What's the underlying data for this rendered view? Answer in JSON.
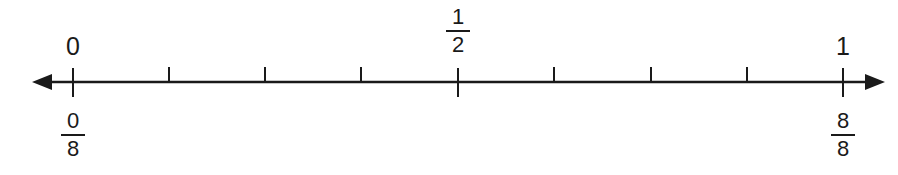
{
  "number_line": {
    "min": 0,
    "max": 1,
    "divisions": 8,
    "line_color": "#1a1a1a",
    "top_labels": {
      "start": "0",
      "middle": {
        "numerator": "1",
        "denominator": "2"
      },
      "end": "1"
    },
    "bottom_labels": {
      "start": {
        "numerator": "0",
        "denominator": "8"
      },
      "end": {
        "numerator": "8",
        "denominator": "8"
      }
    },
    "ticks": [
      {
        "position": "0/8",
        "major": true
      },
      {
        "position": "1/8",
        "major": false
      },
      {
        "position": "2/8",
        "major": false
      },
      {
        "position": "3/8",
        "major": false
      },
      {
        "position": "4/8",
        "major": true
      },
      {
        "position": "5/8",
        "major": false
      },
      {
        "position": "6/8",
        "major": false
      },
      {
        "position": "7/8",
        "major": false
      },
      {
        "position": "8/8",
        "major": true
      }
    ]
  }
}
